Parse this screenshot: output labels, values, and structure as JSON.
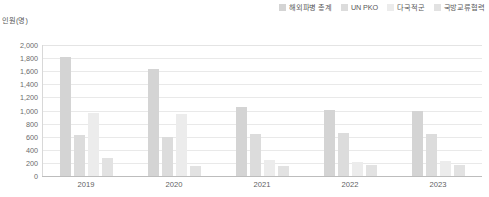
{
  "axis_title": "인원(명)",
  "legend": {
    "items": [
      {
        "label": "해외파병 총계",
        "color": "#d4d4d4"
      },
      {
        "label": "UN PKO",
        "color": "#dcdcdc"
      },
      {
        "label": "다국적군",
        "color": "#ececec"
      },
      {
        "label": "국방교류협력",
        "color": "#e2e2e2"
      }
    ]
  },
  "chart_data": {
    "type": "bar",
    "title": "",
    "subtitle": "",
    "xlabel": "",
    "ylabel": "인원(명)",
    "ylim": [
      0,
      2000
    ],
    "ytick_step": 200,
    "ytick_labels": [
      "2,000",
      "1,800",
      "1,600",
      "1,400",
      "1,200",
      "1,000",
      "800",
      "600",
      "400",
      "200",
      "0"
    ],
    "ytick_values": [
      2000,
      1800,
      1600,
      1400,
      1200,
      1000,
      800,
      600,
      400,
      200,
      0
    ],
    "grid": true,
    "legend_position": "top-right",
    "categories": [
      "2019",
      "2020",
      "2021",
      "2022",
      "2023"
    ],
    "series": [
      {
        "name": "해외파병 총계",
        "color": "#d4d4d4",
        "values": [
          1820,
          1640,
          1060,
          1010,
          1000
        ]
      },
      {
        "name": "UN PKO",
        "color": "#dcdcdc",
        "values": [
          620,
          600,
          640,
          650,
          640
        ]
      },
      {
        "name": "다국적군",
        "color": "#ececec",
        "values": [
          960,
          950,
          250,
          220,
          230
        ]
      },
      {
        "name": "국방교류협력",
        "color": "#e2e2e2",
        "values": [
          270,
          150,
          160,
          170,
          170
        ]
      }
    ]
  }
}
